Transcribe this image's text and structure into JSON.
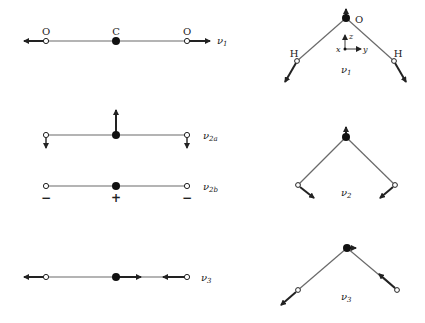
{
  "colors": {
    "line": "#6a6a6a",
    "atom_filled": "#111111",
    "arrow": "#222222",
    "background": "#ffffff"
  },
  "linear_molecule": {
    "atoms": {
      "left": "O",
      "center": "C",
      "right": "O"
    },
    "modes": {
      "v1": {
        "label": "ν",
        "sub": "1"
      },
      "v2a": {
        "label": "ν",
        "sub": "2a"
      },
      "v2b": {
        "label": "ν",
        "sub": "2b",
        "signs": {
          "left": "−",
          "center": "+",
          "right": "−"
        }
      },
      "v3": {
        "label": "ν",
        "sub": "3"
      }
    }
  },
  "bent_molecule": {
    "atoms": {
      "top": "O",
      "left": "H",
      "right": "H"
    },
    "axes": {
      "x": "x",
      "y": "y",
      "z": "z"
    },
    "modes": {
      "v1": {
        "label": "ν",
        "sub": "1"
      },
      "v2": {
        "label": "ν",
        "sub": "2"
      },
      "v3": {
        "label": "ν",
        "sub": "3"
      }
    }
  }
}
